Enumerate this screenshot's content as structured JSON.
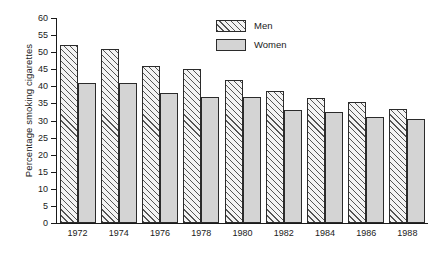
{
  "chart_data": {
    "type": "bar",
    "title": "",
    "xlabel": "",
    "ylabel": "Percentage smoking cigarettes",
    "categories": [
      "1972",
      "1974",
      "1976",
      "1978",
      "1980",
      "1982",
      "1984",
      "1986",
      "1988"
    ],
    "series": [
      {
        "name": "Men",
        "values": [
          52,
          51,
          46,
          45,
          42,
          38.5,
          36.5,
          35.5,
          33.5
        ]
      },
      {
        "name": "Women",
        "values": [
          41,
          41,
          38,
          37,
          37,
          33,
          32.5,
          31,
          30.5
        ]
      }
    ],
    "ylim": [
      0,
      60
    ],
    "yticks": [
      0,
      5,
      10,
      15,
      20,
      25,
      30,
      35,
      40,
      45,
      50,
      55,
      60
    ],
    "ytick_labels": [
      "0",
      "5",
      "10",
      "15",
      "20",
      "25",
      "30",
      "35",
      "40",
      "45",
      "50",
      "55",
      "60"
    ],
    "grid": false,
    "legend_position": "top-right",
    "legend": [
      {
        "label": "Men",
        "pattern": "diagonal-hatch",
        "color": "#f4f4f4"
      },
      {
        "label": "Women",
        "pattern": "solid",
        "color": "#d4d4d4"
      }
    ],
    "colors": {
      "men_fill": "#f4f4f4",
      "men_hatch": "#555555",
      "women_fill": "#d4d4d4",
      "outline": "#2b2b2b",
      "axis": "#1a1a1a",
      "background": "#ffffff"
    }
  }
}
